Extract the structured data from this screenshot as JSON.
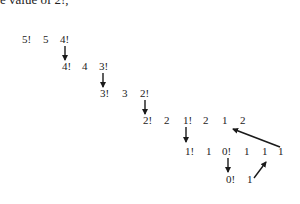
{
  "document": {
    "header_text": "e value of 2!,"
  },
  "diagram": {
    "rows": [
      {
        "tokens": [
          {
            "text": "5!",
            "x": 22,
            "y": 34
          },
          {
            "text": "5",
            "x": 43,
            "y": 34
          },
          {
            "text": "4!",
            "x": 60,
            "y": 34
          }
        ]
      },
      {
        "tokens": [
          {
            "text": "4!",
            "x": 62,
            "y": 61
          },
          {
            "text": "4",
            "x": 82,
            "y": 61
          },
          {
            "text": "3!",
            "x": 99,
            "y": 61
          }
        ]
      },
      {
        "tokens": [
          {
            "text": "3!",
            "x": 100,
            "y": 88
          },
          {
            "text": "3",
            "x": 122,
            "y": 88
          },
          {
            "text": "2!",
            "x": 140,
            "y": 88
          }
        ]
      },
      {
        "tokens": [
          {
            "text": "2!",
            "x": 143,
            "y": 115
          },
          {
            "text": "2",
            "x": 164,
            "y": 115
          },
          {
            "text": "1!",
            "x": 183,
            "y": 115
          },
          {
            "text": "2",
            "x": 203,
            "y": 115
          },
          {
            "text": "1",
            "x": 222,
            "y": 115
          },
          {
            "text": "2",
            "x": 240,
            "y": 115
          }
        ]
      },
      {
        "tokens": [
          {
            "text": "1!",
            "x": 185,
            "y": 146
          },
          {
            "text": "1",
            "x": 206,
            "y": 146
          },
          {
            "text": "0!",
            "x": 222,
            "y": 146
          },
          {
            "text": "1",
            "x": 244,
            "y": 146
          },
          {
            "text": "1",
            "x": 262,
            "y": 146
          },
          {
            "text": "1",
            "x": 278,
            "y": 146
          }
        ]
      },
      {
        "tokens": [
          {
            "text": "0!",
            "x": 226,
            "y": 174
          },
          {
            "text": "1",
            "x": 247,
            "y": 174
          }
        ]
      }
    ],
    "arrows": [
      {
        "name": "arrow-4-fact-down",
        "x1": 65,
        "y1": 46,
        "x2": 65,
        "y2": 61
      },
      {
        "name": "arrow-3-fact-down",
        "x1": 103,
        "y1": 73,
        "x2": 103,
        "y2": 88
      },
      {
        "name": "arrow-2-fact-down",
        "x1": 145,
        "y1": 100,
        "x2": 145,
        "y2": 115
      },
      {
        "name": "arrow-1-fact-down",
        "x1": 186,
        "y1": 127,
        "x2": 186,
        "y2": 143
      },
      {
        "name": "arrow-0-fact-down",
        "x1": 228,
        "y1": 158,
        "x2": 228,
        "y2": 173
      },
      {
        "name": "arrow-return-1",
        "x1": 254,
        "y1": 178,
        "x2": 266,
        "y2": 162
      },
      {
        "name": "arrow-return-2",
        "x1": 280,
        "y1": 147,
        "x2": 232,
        "y2": 129
      }
    ],
    "colors": {
      "text": "#222222",
      "arrow": "#1a1a1a",
      "background": "#ffffff"
    }
  }
}
